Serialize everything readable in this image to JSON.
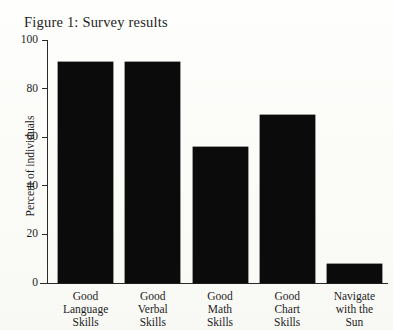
{
  "figure": {
    "title": "Figure 1: Survey results"
  },
  "chart_data": {
    "type": "bar",
    "title": "Figure 1: Survey results",
    "xlabel": "",
    "ylabel": "Percent of individuals",
    "ylim": [
      0,
      100
    ],
    "yticks": [
      0,
      20,
      40,
      60,
      80,
      100
    ],
    "ytick_labels": [
      "0",
      "20",
      "40",
      "60",
      "80",
      "100"
    ],
    "grid": false,
    "legend": false,
    "bar_color": "#0b0b0b",
    "categories": [
      "Good Language Skills",
      "Good Verbal Skills",
      "Good Math Skills",
      "Good Chart Skills",
      "Navigate with the Sun"
    ],
    "category_lines": [
      [
        "Good",
        "Language",
        "Skills"
      ],
      [
        "Good",
        "Verbal",
        "Skills"
      ],
      [
        "Good",
        "Math",
        "Skills"
      ],
      [
        "Good",
        "Chart",
        "Skills"
      ],
      [
        "Navigate",
        "with the",
        "Sun"
      ]
    ],
    "values": [
      91,
      91,
      56,
      69,
      8
    ]
  }
}
